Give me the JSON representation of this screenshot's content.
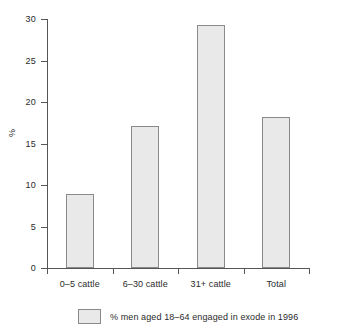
{
  "chart_data": {
    "type": "bar",
    "title": "",
    "subtitle": "",
    "xlabel": "",
    "ylabel": "%",
    "categories": [
      "0–5 cattle",
      "6–30 cattle",
      "31+ cattle",
      "Total"
    ],
    "values": [
      8.9,
      17.1,
      29.3,
      18.2
    ],
    "series": [
      {
        "name": "% men aged 18–64 engaged in exode in 1996",
        "values": [
          8.9,
          17.1,
          29.3,
          18.2
        ]
      }
    ],
    "ylim": [
      0,
      30
    ],
    "yticks": [
      0,
      5,
      10,
      15,
      20,
      25,
      30
    ],
    "ytick_labels": [
      "0",
      "5",
      "10",
      "15",
      "20",
      "25",
      "30"
    ],
    "grid": false,
    "legend_position": "bottom",
    "bar_fill_color": "#e9e9e9",
    "bar_border_color": "#8a8a8a",
    "axis_color": "#555555",
    "text_color": "#2b2b2b",
    "background_color": "#ffffff"
  },
  "legend": {
    "entries": [
      {
        "label": "% men aged 18–64 engaged in exode in 1996"
      }
    ]
  }
}
